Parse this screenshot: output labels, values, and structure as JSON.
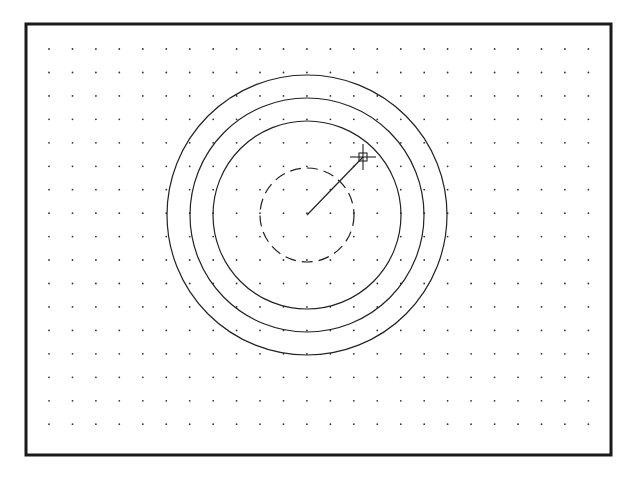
{
  "drawing": {
    "frame": {
      "x": 26,
      "y": 24,
      "width": 585,
      "height": 431,
      "stroke": "#1a1a1a",
      "stroke_width": 3
    },
    "grid": {
      "x0": 49,
      "y0": 49,
      "spacing": 23.45,
      "cols": 24,
      "rows": 17,
      "dot_color": "#333333",
      "dot_radius": 0.9
    },
    "center": {
      "x": 307,
      "y": 215
    },
    "circles": [
      {
        "name": "outer-circle",
        "r": 140,
        "style": "solid"
      },
      {
        "name": "middle-circle",
        "r": 117,
        "style": "solid"
      },
      {
        "name": "inner-circle",
        "r": 94,
        "style": "solid"
      },
      {
        "name": "rubberband-circle",
        "r": 47,
        "style": "dashed"
      }
    ],
    "radius_line": {
      "x2": 363,
      "y2": 157
    },
    "cursor": {
      "x": 363,
      "y": 157,
      "pickbox_size": 8,
      "crosshair_size": 13
    },
    "line_color": "#222222"
  }
}
